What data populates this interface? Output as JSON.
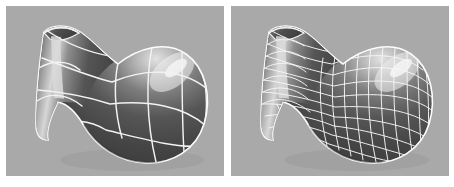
{
  "figure": {
    "name": "subdivision-surface-comparison",
    "panel_count": 2,
    "background_color": "#ffffff",
    "panel_background_color": "#a9a9a9"
  },
  "panels": [
    {
      "id": "left",
      "label": "",
      "object_name": "vase-gourd-surface",
      "mesh_style": "coarse-control-mesh",
      "mesh_columns": 6,
      "mesh_rows": 5,
      "wireframe_color": "#f2f2f2",
      "surface_color_dark": "#4a4a4a",
      "surface_color_mid": "#6b6b6b",
      "surface_color_highlight": "#e8e8e8",
      "shading": "smooth-gouraud",
      "silhouette_color": "#fdfdfd",
      "shadow": true
    },
    {
      "id": "right",
      "label": "",
      "object_name": "vase-gourd-surface",
      "mesh_style": "fine-subdivided-mesh",
      "mesh_columns": 16,
      "mesh_rows": 14,
      "wireframe_color": "#f6f6f6",
      "surface_color_dark": "#4a4a4a",
      "surface_color_mid": "#6b6b6b",
      "surface_color_highlight": "#e8e8e8",
      "shading": "smooth-gouraud",
      "silhouette_color": "#fdfdfd",
      "shadow": true
    }
  ],
  "shape_description": {
    "form": "bulbous body with flared funnel neck",
    "orientation": "neck pointing upper-left, bulb lower-right"
  }
}
